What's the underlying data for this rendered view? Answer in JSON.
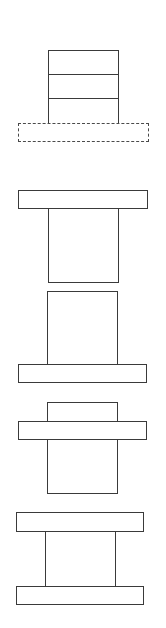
{
  "diagram": {
    "type": "block-configurations",
    "background": "#ffffff",
    "stroke_color": "#3a3a3a",
    "figures": [
      {
        "id": "fig-1",
        "description": "stacked blocks on dashed base",
        "shapes": [
          {
            "role": "stack",
            "style": "solid",
            "x": 48,
            "y": 50,
            "w": 71,
            "h": 74,
            "dividers_y": [
              74,
              98
            ]
          },
          {
            "role": "base",
            "style": "dashed",
            "x": 18,
            "y": 123,
            "w": 131,
            "h": 19
          }
        ]
      },
      {
        "id": "fig-2",
        "description": "bar on top of block",
        "shapes": [
          {
            "role": "top-bar",
            "style": "solid",
            "x": 18,
            "y": 190,
            "w": 130,
            "h": 19
          },
          {
            "role": "body",
            "style": "solid",
            "x": 48,
            "y": 208,
            "w": 71,
            "h": 75
          }
        ]
      },
      {
        "id": "fig-3",
        "description": "block on top of bar",
        "shapes": [
          {
            "role": "body",
            "style": "solid",
            "x": 47,
            "y": 291,
            "w": 71,
            "h": 74
          },
          {
            "role": "bottom-bar",
            "style": "solid",
            "x": 18,
            "y": 364,
            "w": 129,
            "h": 19
          }
        ]
      },
      {
        "id": "fig-4",
        "description": "bar crossing block",
        "shapes": [
          {
            "role": "top-cap",
            "style": "solid",
            "x": 47,
            "y": 402,
            "w": 71,
            "h": 20
          },
          {
            "role": "middle-bar",
            "style": "solid",
            "x": 18,
            "y": 421,
            "w": 129,
            "h": 19
          },
          {
            "role": "body",
            "style": "solid",
            "x": 47,
            "y": 439,
            "w": 71,
            "h": 55
          }
        ]
      },
      {
        "id": "fig-5",
        "description": "block between two bars",
        "shapes": [
          {
            "role": "top-bar",
            "style": "solid",
            "x": 16,
            "y": 512,
            "w": 128,
            "h": 20
          },
          {
            "role": "body",
            "style": "solid",
            "x": 45,
            "y": 531,
            "w": 71,
            "h": 56
          },
          {
            "role": "bottom-bar",
            "style": "solid",
            "x": 16,
            "y": 586,
            "w": 128,
            "h": 19
          }
        ]
      }
    ]
  }
}
